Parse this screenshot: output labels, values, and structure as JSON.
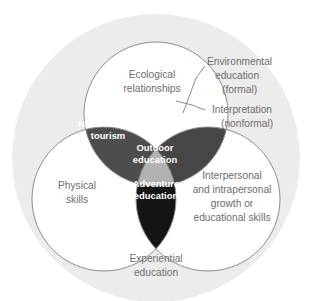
{
  "diagram": {
    "type": "venn-3-circle-with-universe",
    "universe": {
      "label": "Experiential education",
      "label_lines": [
        "Experiential",
        "education"
      ],
      "fill": "#ececeb"
    },
    "circles": [
      {
        "id": "top",
        "label": "Ecological relationships",
        "label_lines": [
          "Ecological",
          "relationships"
        ],
        "fill": "#ffffff",
        "stroke": "#8e8e8e"
      },
      {
        "id": "bottom-left",
        "label": "Physical skills",
        "label_lines": [
          "Physical",
          "skills"
        ],
        "fill": "#ffffff",
        "stroke": "#8e8e8e"
      },
      {
        "id": "bottom-right",
        "label": "Interpersonal and intrapersonal growth or educational skills",
        "label_lines": [
          "Interpersonal",
          "and intrapersonal",
          "growth or",
          "educational skills"
        ],
        "fill": "#ffffff",
        "stroke": "#8e8e8e"
      }
    ],
    "intersections": [
      {
        "id": "top-left-lens",
        "label": "Nature-based tourism",
        "label_lines": [
          "Nature-based",
          "tourism"
        ],
        "fill": "#4d4d4d",
        "text_color": "#ffffff"
      },
      {
        "id": "top-right-lens",
        "label": "Environmental education (formal) / Interpretation (nonformal)",
        "label_lines": [],
        "fill": "#464646",
        "text_color": "#ffffff"
      },
      {
        "id": "bottom-lens",
        "label": "Adventure education",
        "label_lines": [
          "Adventure",
          "education"
        ],
        "fill": "#141414",
        "text_color": "#ffffff"
      },
      {
        "id": "center",
        "label": "Outdoor education",
        "label_lines": [
          "Outdoor",
          "education"
        ],
        "fill": "#b2b2b2",
        "text_color": "#ffffff"
      }
    ],
    "callouts": [
      {
        "id": "environmental-education",
        "label": "Environmental education (formal)",
        "label_lines": [
          "Environmental",
          "education",
          "(formal)"
        ]
      },
      {
        "id": "interpretation",
        "label": "Interpretation (nonformal)",
        "label_lines": [
          "Interpretation",
          "(nonformal)"
        ]
      }
    ],
    "colors": {
      "background": "#ffffff",
      "outer_ring": "#ececeb",
      "circle_stroke": "#8e8e8e",
      "text_gray": "#6d6d6d",
      "leader_line": "#7d7d7d"
    }
  }
}
